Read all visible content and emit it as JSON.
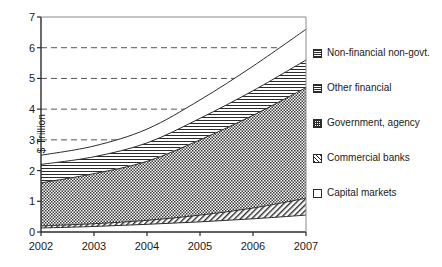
{
  "chart_data": {
    "type": "area",
    "stacked": true,
    "title": "",
    "subtitle": "",
    "xlabel": "",
    "ylabel": "$ Trillion",
    "x": [
      2002,
      2003,
      2004,
      2005,
      2006,
      2007
    ],
    "xtick_labels": [
      "2002",
      "2003",
      "2004",
      "2005",
      "2006",
      "2007"
    ],
    "ytick_labels": [
      "0",
      "1",
      "2",
      "3",
      "4",
      "5",
      "6",
      "7"
    ],
    "yticks": [
      0,
      1,
      2,
      3,
      4,
      5,
      6,
      7
    ],
    "ylim": [
      0,
      7
    ],
    "xlim": [
      2002,
      2007
    ],
    "grid": "horizontal-dashed",
    "legend_position": "right",
    "series": [
      {
        "name": "Capital markets",
        "fill": "plain-white",
        "values": [
          0.13,
          0.18,
          0.25,
          0.33,
          0.43,
          0.55
        ]
      },
      {
        "name": "Commercial banks",
        "fill": "diagonal-hatch",
        "values": [
          0.07,
          0.09,
          0.13,
          0.22,
          0.35,
          0.55
        ]
      },
      {
        "name": "Government, agency",
        "fill": "checkerboard",
        "values": [
          1.4,
          1.63,
          1.92,
          2.45,
          3.02,
          3.6
        ]
      },
      {
        "name": "Other financial",
        "fill": "horizontal-lines",
        "values": [
          0.6,
          0.55,
          0.6,
          0.7,
          0.8,
          0.9
        ]
      },
      {
        "name": "Non-financial non-govt.",
        "fill": "plain-white",
        "values": [
          0.3,
          0.35,
          0.45,
          0.6,
          0.8,
          1.0
        ]
      }
    ],
    "cumulative_tops": {
      "Capital markets": [
        0.13,
        0.18,
        0.25,
        0.33,
        0.43,
        0.55
      ],
      "Commercial banks": [
        0.2,
        0.27,
        0.38,
        0.55,
        0.78,
        1.1
      ],
      "Government, agency": [
        1.6,
        1.9,
        2.3,
        3.0,
        3.8,
        4.7
      ],
      "Other financial": [
        2.2,
        2.45,
        2.9,
        3.7,
        4.6,
        5.6
      ],
      "Non-financial non-govt.": [
        2.5,
        2.8,
        3.35,
        4.3,
        5.4,
        6.6
      ]
    }
  },
  "legend": {
    "items": [
      {
        "label": "Non-financial non-govt.",
        "swatch": "sw-hline"
      },
      {
        "label": "Other financial",
        "swatch": "sw-hline-dark"
      },
      {
        "label": "Government, agency",
        "swatch": "sw-check"
      },
      {
        "label": "Commercial banks",
        "swatch": "sw-diag"
      },
      {
        "label": "Capital markets",
        "swatch": "sw-plain"
      }
    ]
  },
  "colors": {
    "ink": "#2b2b2b",
    "grid": "#555555",
    "background": "#ffffff"
  }
}
